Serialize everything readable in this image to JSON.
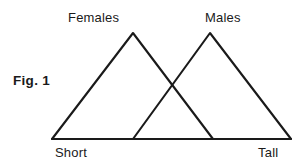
{
  "figure": {
    "caption": "Fig. 1",
    "background_color": "#ffffff",
    "line_color": "#1a1a1a"
  },
  "chart_data": {
    "type": "line",
    "title": "Fig. 1",
    "xlabel": "",
    "ylabel": "",
    "xlim": [
      0,
      100
    ],
    "ylim": [
      0,
      100
    ],
    "grid": false,
    "legend": "inline-above-peaks",
    "x_tick_labels": [
      "Short",
      "Tall"
    ],
    "y_tick_labels": [],
    "annotations": [
      {
        "text": "Females",
        "x": 34,
        "y": 108
      },
      {
        "text": "Males",
        "x": 66,
        "y": 108
      },
      {
        "text": "Short",
        "x": 2,
        "y": -8
      },
      {
        "text": "Tall",
        "x": 88,
        "y": -8
      }
    ],
    "series": [
      {
        "name": "Females",
        "shape": "triangle",
        "x": [
          0,
          34,
          67
        ],
        "values": [
          0,
          100,
          0
        ],
        "peak_x": 34,
        "peak_value": 100
      },
      {
        "name": "Males",
        "shape": "triangle",
        "x": [
          34,
          66,
          100
        ],
        "values": [
          0,
          100,
          0
        ],
        "peak_x": 66,
        "peak_value": 100
      }
    ],
    "overlap": {
      "crossing_x": 50,
      "crossing_value": 50
    }
  },
  "labels": {
    "females": "Females",
    "males": "Males",
    "short": "Short",
    "tall": "Tall"
  },
  "geometry": {
    "baseline": {
      "x1": 52,
      "y1": 139,
      "x2": 291,
      "y2": 139
    },
    "females_triangle": "M52,139 L133,33 L213,139",
    "males_triangle": "M133,139 L210,33 L291,139"
  }
}
